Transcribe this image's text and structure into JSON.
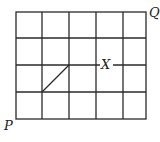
{
  "diagram": {
    "type": "grid-path",
    "columns": 5,
    "rows": 4,
    "grid": {
      "left": 16,
      "top": 12,
      "right": 146,
      "bottom": 119
    },
    "line_color": "#2a2a2a",
    "labels": {
      "P": "P",
      "Q": "Q",
      "X": "X"
    },
    "segment": {
      "description": "diagonal across one cell",
      "from_cell_corner": [
        1,
        1
      ],
      "to_cell_corner": [
        2,
        2
      ]
    }
  }
}
